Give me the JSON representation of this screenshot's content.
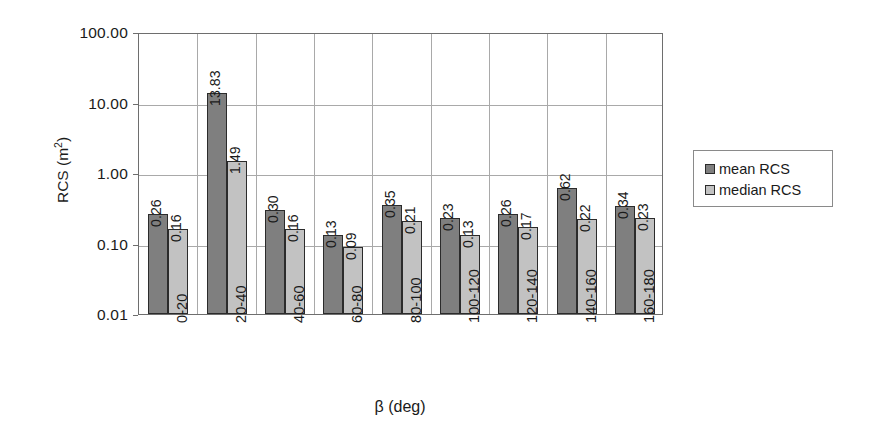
{
  "chart_data": {
    "type": "bar",
    "title": "",
    "xlabel": "β (deg)",
    "ylabel": "RCS (m²)",
    "yscale": "log",
    "ylim": [
      0.01,
      100
    ],
    "ytick_labels": [
      "100.00",
      "10.00",
      "1.00",
      "0.10",
      "0.01"
    ],
    "ytick_values": [
      100,
      10,
      1,
      0.1,
      0.01
    ],
    "grid": "horizontal-and-vertical",
    "legend_position": "right",
    "categories": [
      "0-20",
      "20-40",
      "40-60",
      "60-80",
      "80-100",
      "100-120",
      "120-140",
      "140-160",
      "160-180"
    ],
    "series": [
      {
        "name": "mean RCS",
        "color": "#7f7f7f",
        "values": [
          0.26,
          13.83,
          0.3,
          0.13,
          0.35,
          0.23,
          0.26,
          0.62,
          0.34
        ],
        "labels": [
          "0.26",
          "13.83",
          "0.30",
          "0.13",
          "0.35",
          "0.23",
          "0.26",
          "0.62",
          "0.34"
        ]
      },
      {
        "name": "median RCS",
        "color": "#c2c2c2",
        "values": [
          0.16,
          1.49,
          0.16,
          0.09,
          0.21,
          0.13,
          0.17,
          0.22,
          0.23
        ],
        "labels": [
          "0.16",
          "1.49",
          "0.16",
          "0.09",
          "0.21",
          "0.13",
          "0.17",
          "0.22",
          "0.23"
        ]
      }
    ]
  },
  "axes": {
    "y_title": "RCS (m",
    "y_title_exp": "2",
    "y_title_close": ")",
    "x_title": "β (deg)"
  },
  "legend": {
    "items": [
      {
        "label": "mean RCS",
        "color": "#7f7f7f"
      },
      {
        "label": "median RCS",
        "color": "#c2c2c2"
      }
    ]
  },
  "colors": {
    "mean": "#7f7f7f",
    "median": "#c2c2c2",
    "grid": "#a9a9a9",
    "frame": "#6e6e6e",
    "bar_edge": "#2b2b2b",
    "background": "#ffffff"
  }
}
